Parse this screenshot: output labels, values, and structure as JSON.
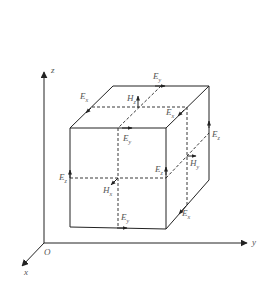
{
  "diagram": {
    "type": "yee-cell",
    "axes": {
      "z": "z",
      "y": "y",
      "x": "x",
      "origin": "O"
    },
    "labels": [
      {
        "id": "ex-top-left",
        "base": "E",
        "sub": "x",
        "x": 80,
        "y": 92
      },
      {
        "id": "ey-top-back",
        "base": "E",
        "sub": "y",
        "x": 153,
        "y": 72
      },
      {
        "id": "hz-top",
        "base": "H",
        "sub": "z",
        "x": 127,
        "y": 94
      },
      {
        "id": "ex-top-right",
        "base": "E",
        "sub": "x",
        "x": 166,
        "y": 108
      },
      {
        "id": "ey-top-front",
        "base": "E",
        "sub": "y",
        "x": 123,
        "y": 134
      },
      {
        "id": "ez-back-right",
        "base": "E",
        "sub": "z",
        "x": 212,
        "y": 130
      },
      {
        "id": "hy-right",
        "base": "H",
        "sub": "y",
        "x": 190,
        "y": 159
      },
      {
        "id": "ez-mid-right",
        "base": "E",
        "sub": "z",
        "x": 155,
        "y": 165
      },
      {
        "id": "ez-left",
        "base": "E",
        "sub": "z",
        "x": 59,
        "y": 173
      },
      {
        "id": "hx-front",
        "base": "H",
        "sub": "x",
        "x": 103,
        "y": 186
      },
      {
        "id": "ey-bottom",
        "base": "E",
        "sub": "y",
        "x": 121,
        "y": 213
      },
      {
        "id": "ex-bottom-right",
        "base": "E",
        "sub": "x",
        "x": 182,
        "y": 209
      }
    ],
    "colors": {
      "stroke": "#222222",
      "label": "#555555",
      "background": "#ffffff"
    }
  }
}
